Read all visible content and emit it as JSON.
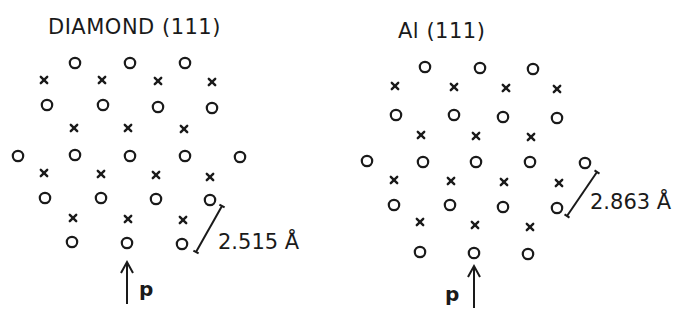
{
  "panels": [
    {
      "id": "diamond",
      "title": "DIAMOND (111)",
      "title_pos": [
        48,
        34
      ],
      "circles": [
        [
          75,
          63
        ],
        [
          130,
          63
        ],
        [
          185,
          63
        ],
        [
          47,
          105
        ],
        [
          103,
          105
        ],
        [
          158,
          107
        ],
        [
          212,
          108
        ],
        [
          18,
          156
        ],
        [
          75,
          155
        ],
        [
          130,
          156
        ],
        [
          185,
          156
        ],
        [
          240,
          157
        ],
        [
          45,
          198
        ],
        [
          101,
          198
        ],
        [
          156,
          199
        ],
        [
          210,
          200
        ],
        [
          72,
          242
        ],
        [
          127,
          243
        ],
        [
          182,
          244
        ]
      ],
      "crosses": [
        [
          44,
          80
        ],
        [
          102,
          80
        ],
        [
          158,
          81
        ],
        [
          212,
          82
        ],
        [
          74,
          128
        ],
        [
          128,
          128
        ],
        [
          184,
          129
        ],
        [
          44,
          173
        ],
        [
          101,
          174
        ],
        [
          156,
          175
        ],
        [
          210,
          177
        ],
        [
          73,
          218
        ],
        [
          128,
          219
        ],
        [
          183,
          220
        ]
      ],
      "measure": {
        "from": [
          222,
          206
        ],
        "to": [
          196,
          252
        ],
        "label": "2.515 Å",
        "label_pos": [
          218,
          249
        ]
      },
      "arrow": {
        "x": 127,
        "y_top": 262,
        "y_bottom": 304
      },
      "p_label": {
        "text": "p",
        "pos": [
          139,
          296
        ]
      }
    },
    {
      "id": "aluminium",
      "title": "Al (111)",
      "title_pos": [
        398,
        38
      ],
      "circles": [
        [
          425,
          67
        ],
        [
          480,
          68
        ],
        [
          533,
          69
        ],
        [
          396,
          115
        ],
        [
          454,
          115
        ],
        [
          503,
          117
        ],
        [
          557,
          118
        ],
        [
          367,
          161
        ],
        [
          423,
          162
        ],
        [
          476,
          162
        ],
        [
          530,
          162
        ],
        [
          585,
          163
        ],
        [
          394,
          205
        ],
        [
          450,
          205
        ],
        [
          503,
          207
        ],
        [
          557,
          208
        ],
        [
          420,
          252
        ],
        [
          474,
          253
        ],
        [
          528,
          254
        ]
      ],
      "crosses": [
        [
          395,
          86
        ],
        [
          454,
          87
        ],
        [
          506,
          88
        ],
        [
          557,
          89
        ],
        [
          421,
          135
        ],
        [
          476,
          136
        ],
        [
          531,
          137
        ],
        [
          394,
          180
        ],
        [
          451,
          181
        ],
        [
          504,
          182
        ],
        [
          559,
          183
        ],
        [
          420,
          222
        ],
        [
          475,
          225
        ],
        [
          530,
          227
        ]
      ],
      "measure": {
        "from": [
          597,
          172
        ],
        "to": [
          567,
          216
        ],
        "label": "2.863 Å",
        "label_pos": [
          590,
          209
        ]
      },
      "arrow": {
        "x": 474,
        "y_top": 266,
        "y_bottom": 308
      },
      "p_label": {
        "text": "p",
        "pos": [
          445,
          301
        ]
      }
    }
  ],
  "legend": {
    "circle_marker": "o",
    "cross_marker": "x"
  }
}
